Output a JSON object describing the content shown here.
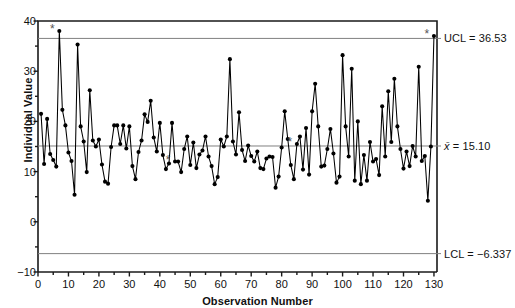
{
  "chart_data": {
    "type": "line",
    "title": "",
    "subtitle": "",
    "xlabel": "Observation Number",
    "ylabel": "Individual Value",
    "xlim": [
      0,
      131
    ],
    "ylim": [
      -10,
      40
    ],
    "grid": false,
    "legend": "none",
    "legend_position": "none",
    "marker": "filled-circle",
    "series_name": "Individual Value",
    "x": [
      1,
      2,
      3,
      4,
      5,
      6,
      7,
      8,
      9,
      10,
      11,
      12,
      13,
      14,
      15,
      16,
      17,
      18,
      19,
      20,
      21,
      22,
      23,
      24,
      25,
      26,
      27,
      28,
      29,
      30,
      31,
      32,
      33,
      34,
      35,
      36,
      37,
      38,
      39,
      40,
      41,
      42,
      43,
      44,
      45,
      46,
      47,
      48,
      49,
      50,
      51,
      52,
      53,
      54,
      55,
      56,
      57,
      58,
      59,
      60,
      61,
      62,
      63,
      64,
      65,
      66,
      67,
      68,
      69,
      70,
      71,
      72,
      73,
      74,
      75,
      76,
      77,
      78,
      79,
      80,
      81,
      82,
      83,
      84,
      85,
      86,
      87,
      88,
      89,
      90,
      91,
      92,
      93,
      94,
      95,
      96,
      97,
      98,
      99,
      100,
      101,
      102,
      103,
      104,
      105,
      106,
      107,
      108,
      109,
      110,
      111,
      112,
      113,
      114,
      115,
      116,
      117,
      118,
      119,
      120,
      121,
      122,
      123,
      124,
      125,
      126,
      127,
      128,
      129,
      130
    ],
    "values": [
      21.5,
      11.5,
      20.5,
      13.5,
      12.3,
      11.0,
      38.0,
      22.3,
      19.2,
      13.8,
      12.1,
      5.4,
      35.3,
      19.0,
      16.0,
      9.9,
      26.2,
      16.2,
      15.0,
      16.4,
      11.4,
      8.0,
      7.6,
      14.9,
      19.2,
      19.2,
      15.5,
      19.2,
      14.6,
      19.0,
      11.1,
      8.5,
      13.9,
      16.2,
      21.4,
      19.9,
      24.1,
      16.8,
      14.0,
      19.7,
      13.3,
      10.5,
      11.6,
      19.7,
      12.0,
      12.0,
      9.9,
      14.5,
      17.0,
      11.3,
      15.8,
      10.7,
      13.4,
      14.2,
      17.0,
      13.0,
      11.1,
      7.5,
      8.9,
      16.4,
      15.0,
      17.0,
      32.4,
      16.0,
      13.4,
      21.8,
      14.3,
      12.1,
      15.2,
      13.1,
      12.0,
      14.0,
      10.7,
      10.5,
      12.6,
      13.0,
      12.9,
      6.8,
      9.0,
      14.8,
      22.0,
      16.5,
      11.3,
      8.5,
      15.5,
      17.0,
      10.4,
      18.7,
      9.4,
      22.0,
      27.5,
      19.0,
      11.0,
      11.2,
      14.5,
      18.5,
      13.6,
      7.8,
      9.0,
      33.2,
      19.0,
      13.0,
      30.5,
      8.2,
      20.0,
      7.5,
      13.3,
      8.2,
      15.9,
      12.0,
      12.5,
      9.3,
      23.0,
      13.0,
      26.0,
      15.9,
      28.5,
      19.0,
      14.5,
      10.6,
      14.0,
      11.1,
      15.1,
      13.0,
      30.9,
      12.1,
      13.1,
      4.2,
      15.0,
      37.0
    ],
    "control_limits": {
      "ucl": {
        "value": 36.53,
        "label": "UCL = 36.53"
      },
      "center": {
        "value": 15.1,
        "label_prefix": "x̄",
        "label_value": " = 15.10"
      },
      "lcl": {
        "value": -6.337,
        "label": "LCL = −6.337"
      }
    },
    "out_of_control_points": [
      {
        "x": 7,
        "value": 38.0,
        "marker": "*"
      },
      {
        "x": 45,
        "value": 12.0,
        "marker": "*"
      },
      {
        "x": 85,
        "value": 15.5,
        "marker": "*"
      },
      {
        "x": 130,
        "value": 37.0,
        "marker": "*"
      }
    ],
    "yticks": [
      {
        "value": 40,
        "label": "40"
      },
      {
        "value": 35,
        "label": ""
      },
      {
        "value": 30,
        "label": "30"
      },
      {
        "value": 25,
        "label": ""
      },
      {
        "value": 20,
        "label": "20"
      },
      {
        "value": 15,
        "label": ""
      },
      {
        "value": 10,
        "label": "10"
      },
      {
        "value": 5,
        "label": ""
      },
      {
        "value": 0,
        "label": "0"
      },
      {
        "value": -5,
        "label": ""
      },
      {
        "value": -10,
        "label": "−10"
      }
    ],
    "xticks": [
      {
        "value": 0,
        "label": "0"
      },
      {
        "value": 5,
        "label": ""
      },
      {
        "value": 10,
        "label": "10"
      },
      {
        "value": 15,
        "label": ""
      },
      {
        "value": 20,
        "label": "20"
      },
      {
        "value": 25,
        "label": ""
      },
      {
        "value": 30,
        "label": "30"
      },
      {
        "value": 35,
        "label": ""
      },
      {
        "value": 40,
        "label": "40"
      },
      {
        "value": 45,
        "label": ""
      },
      {
        "value": 50,
        "label": "50"
      },
      {
        "value": 55,
        "label": ""
      },
      {
        "value": 60,
        "label": "60"
      },
      {
        "value": 65,
        "label": ""
      },
      {
        "value": 70,
        "label": "70"
      },
      {
        "value": 75,
        "label": ""
      },
      {
        "value": 80,
        "label": "80"
      },
      {
        "value": 85,
        "label": ""
      },
      {
        "value": 90,
        "label": "90"
      },
      {
        "value": 95,
        "label": ""
      },
      {
        "value": 100,
        "label": "100"
      },
      {
        "value": 105,
        "label": ""
      },
      {
        "value": 110,
        "label": "110"
      },
      {
        "value": 115,
        "label": ""
      },
      {
        "value": 120,
        "label": "120"
      },
      {
        "value": 125,
        "label": ""
      },
      {
        "value": 130,
        "label": "130"
      }
    ],
    "colors": {
      "series": "#000000",
      "limit_line": "#808080",
      "axis": "#1a1a1a",
      "background": "#ffffff",
      "text": "#111111"
    }
  }
}
